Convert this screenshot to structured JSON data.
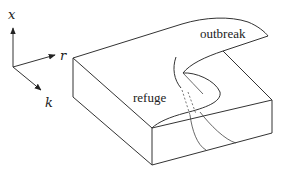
{
  "diagram": {
    "type": "cusp-catastrophe-surface",
    "axes": {
      "x_label": "x",
      "r_label": "r",
      "k_label": "k"
    },
    "regions": {
      "upper_label": "outbreak",
      "lower_label": "refuge"
    },
    "colors": {
      "stroke": "#333333",
      "background": "#ffffff"
    }
  }
}
